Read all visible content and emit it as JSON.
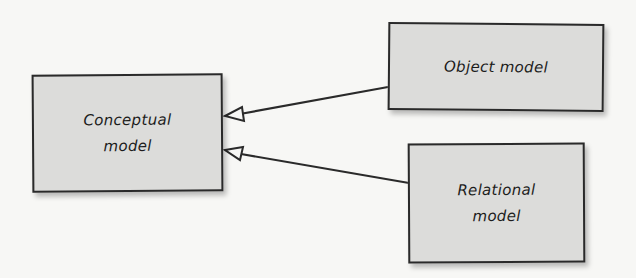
{
  "diagram": {
    "type": "uml-generalization",
    "colors": {
      "background": "#f7f7f5",
      "box_fill": "#dcdcda",
      "stroke": "#2a2a2a"
    },
    "nodes": [
      {
        "id": "conceptual",
        "line1": "Conceptual",
        "line2": "model"
      },
      {
        "id": "object",
        "line1": "Object model",
        "line2": ""
      },
      {
        "id": "relational",
        "line1": "Relational",
        "line2": "model"
      }
    ],
    "edges": [
      {
        "from": "object",
        "to": "conceptual",
        "arrow": "hollow-triangle"
      },
      {
        "from": "relational",
        "to": "conceptual",
        "arrow": "hollow-triangle"
      }
    ]
  }
}
